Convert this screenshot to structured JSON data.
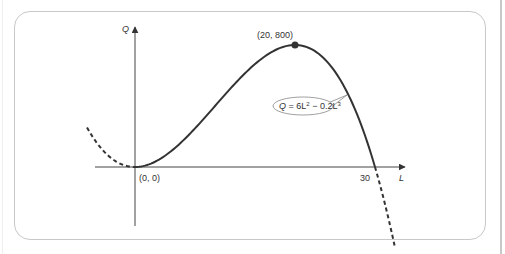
{
  "chart_data": {
    "type": "line",
    "title": "",
    "xlabel": "L",
    "ylabel": "Q",
    "equation": "Q = 6L² − 0.2L³",
    "function": {
      "a2": 6,
      "a3": -0.2
    },
    "solid_domain": [
      0,
      30
    ],
    "dashed_segments": [
      [
        -6,
        0
      ],
      [
        30,
        32.5
      ]
    ],
    "annotated_points": [
      {
        "label": "(0, 0)",
        "x": 0,
        "y": 0
      },
      {
        "label": "(20, 800)",
        "x": 20,
        "y": 800,
        "marker": true
      },
      {
        "label": "30",
        "x": 30,
        "y": 0
      }
    ],
    "xlim": [
      -5,
      33
    ],
    "ylim": [
      -380,
      920
    ],
    "grid": false,
    "legend": "none"
  },
  "labels": {
    "y_axis": "Q",
    "x_axis": "L",
    "origin": "(0, 0)",
    "peak": "(20, 800)",
    "root": "30",
    "eq_Q": "Q",
    "eq_mid": " = 6L",
    "eq_sup1": "2",
    "eq_mid2": " − 0.2L",
    "eq_sup2": "3"
  },
  "colors": {
    "curve": "#333333",
    "axis": "#444444",
    "frame": "#c8c8c8",
    "callout": "#888888"
  }
}
